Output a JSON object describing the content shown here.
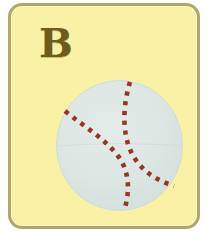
{
  "card": {
    "letter": "B",
    "letter_case": "uppercase",
    "background_color": "#f8f1a6",
    "border_color": "#b3a567",
    "letter_color": "#6d5c1c",
    "corner_radius_px": 14
  },
  "page": {
    "background_color": "#ffffff",
    "width_px": 209,
    "height_px": 235
  },
  "illustration": {
    "name": "baseball",
    "alt_text": "Baseball",
    "ball_fill_color": "#dde7e4",
    "ball_edge_color": "#cfdcd8",
    "stitch_color": "#9b3326",
    "stitch_style": "dashed",
    "center_x_px": 108,
    "center_y_px": 139,
    "radius_px": 63,
    "seam_count": 2
  }
}
